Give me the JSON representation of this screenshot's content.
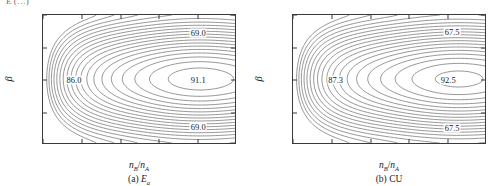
{
  "figure": {
    "cropped_header_text": "E (…) ",
    "panels": [
      {
        "id": "a",
        "caption_prefix": "(a)",
        "caption_symbol": "E",
        "caption_symbol_sub": "a",
        "xlabel_num": "n",
        "xlabel_num_sub": "B",
        "xlabel_den": "n",
        "xlabel_den_sub": "A",
        "ylabel": "β",
        "xticks": [
          "1.0",
          "1.2",
          "1.4",
          "1.6",
          "1.8",
          "2.0"
        ],
        "xlim": [
          1.0,
          2.0
        ],
        "yticks": [
          "π/2",
          "π/4",
          "0",
          "−π/4",
          "−π/2"
        ],
        "ylim": [
          -1.5708,
          1.5708
        ],
        "contour_labels": [
          {
            "text": "69.0",
            "x": 0.8,
            "y": 0.86
          },
          {
            "text": "86.0",
            "x": 0.16,
            "y": 0.5
          },
          {
            "text": "91.1",
            "x": 0.8,
            "y": 0.5
          },
          {
            "text": "69.0",
            "x": 0.8,
            "y": 0.14
          }
        ]
      },
      {
        "id": "b",
        "caption_prefix": "(b)",
        "caption_symbol": "CU",
        "caption_symbol_sub": "",
        "xlabel_num": "n",
        "xlabel_num_sub": "B",
        "xlabel_den": "n",
        "xlabel_den_sub": "A",
        "ylabel": "β",
        "xticks": [
          "1.0",
          "1.2",
          "1.4",
          "1.6",
          "1.8",
          "2.0"
        ],
        "xlim": [
          1.0,
          2.0
        ],
        "yticks": [
          "π/2",
          "π/4",
          "0",
          "−π/4",
          "−π/2"
        ],
        "ylim": [
          -1.5708,
          1.5708
        ],
        "contour_labels": [
          {
            "text": "67.5",
            "x": 0.82,
            "y": 0.87
          },
          {
            "text": "87.3",
            "x": 0.22,
            "y": 0.5
          },
          {
            "text": "92.5",
            "x": 0.8,
            "y": 0.5
          },
          {
            "text": "67.5",
            "x": 0.82,
            "y": 0.13
          }
        ]
      }
    ]
  },
  "chart_data": [
    {
      "type": "contour",
      "panel": "a",
      "title": "(a) E_a",
      "xlabel": "n_B/n_A",
      "ylabel": "beta",
      "xlim": [
        1.0,
        2.0
      ],
      "ylim": [
        -1.5707963,
        1.5707963
      ],
      "xticks": [
        1.0,
        1.2,
        1.4,
        1.6,
        1.8,
        2.0
      ],
      "yticks": [
        1.5707963,
        0.7853982,
        0,
        -0.7853982,
        -1.5707963
      ],
      "ytick_labels": [
        "π/2",
        "π/4",
        "0",
        "−π/4",
        "−π/2"
      ],
      "grid": false,
      "legend": "none",
      "labeled_levels": [
        69.0,
        86.0,
        91.1
      ],
      "level_min": 69.0,
      "level_max": 91.1,
      "saddle_description": "Maximum ridge along beta = 0 peaking near n_B/n_A = 1.8; values decrease toward beta = +-pi/2 and toward n_B/n_A = 1.0",
      "annotations": [
        {
          "text": "69.0",
          "near": "top-right"
        },
        {
          "text": "86.0",
          "near": "left-center"
        },
        {
          "text": "91.1",
          "near": "right-center"
        },
        {
          "text": "69.0",
          "near": "bottom-right"
        }
      ]
    },
    {
      "type": "contour",
      "panel": "b",
      "title": "(b) CU",
      "xlabel": "n_B/n_A",
      "ylabel": "beta",
      "xlim": [
        1.0,
        2.0
      ],
      "ylim": [
        -1.5707963,
        1.5707963
      ],
      "xticks": [
        1.0,
        1.2,
        1.4,
        1.6,
        1.8,
        2.0
      ],
      "yticks": [
        1.5707963,
        0.7853982,
        0,
        -0.7853982,
        -1.5707963
      ],
      "ytick_labels": [
        "π/2",
        "π/4",
        "0",
        "−π/4",
        "−π/2"
      ],
      "grid": false,
      "legend": "none",
      "labeled_levels": [
        67.5,
        87.3,
        92.5
      ],
      "level_min": 67.5,
      "level_max": 92.5,
      "saddle_description": "Maximum ridge along beta = 0 peaking near n_B/n_A = 1.85; values decrease toward beta = +-pi/2 and toward n_B/n_A = 1.0",
      "annotations": [
        {
          "text": "67.5",
          "near": "top-right"
        },
        {
          "text": "87.3",
          "near": "left-center"
        },
        {
          "text": "92.5",
          "near": "right-center"
        },
        {
          "text": "67.5",
          "near": "bottom-right"
        }
      ]
    }
  ]
}
